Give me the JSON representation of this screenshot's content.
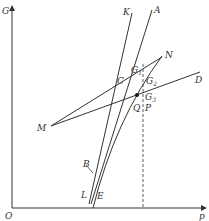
{
  "axes": {
    "y_label": "G",
    "x_label": "p",
    "origin_label": "O"
  },
  "curves": [
    {
      "name": "K",
      "label": "K"
    },
    {
      "name": "A",
      "label": "A"
    },
    {
      "name": "L",
      "label": "L"
    },
    {
      "name": "E",
      "label": "E"
    },
    {
      "name": "MN",
      "label_start": "M",
      "label_end": "N"
    },
    {
      "name": "MD",
      "label_end": "D"
    }
  ],
  "points": {
    "C": "C",
    "B": "B",
    "Q": "Q",
    "P": "P",
    "G1": "G",
    "G1_sub": "1",
    "G2": "G",
    "G2_sub": "2",
    "G3": "G",
    "G3_sub": "3"
  }
}
